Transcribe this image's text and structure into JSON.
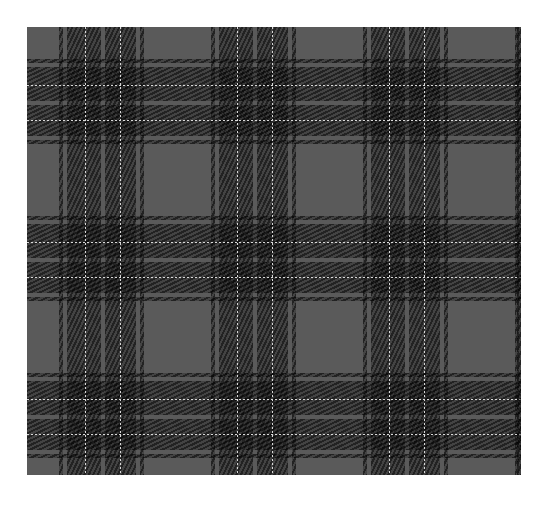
{
  "image": {
    "description": "Gray and black tartan plaid fabric pattern",
    "colors": {
      "base": "#5a5a5a",
      "dark": "#000000",
      "pinstripe": "#d8d8d8",
      "background": "#ffffff"
    },
    "pattern": {
      "repeats_x": 3,
      "repeats_y": 3,
      "period_x": 152,
      "period_y": 157,
      "stripe_set": [
        {
          "type": "dark",
          "offset": 0,
          "width": 4
        },
        {
          "type": "dark",
          "offset": 8,
          "width": 34
        },
        {
          "type": "white",
          "offset": 26,
          "width": 1
        },
        {
          "type": "dark",
          "offset": 46,
          "width": 31
        },
        {
          "type": "white",
          "offset": 61,
          "width": 1
        },
        {
          "type": "dark",
          "offset": 81,
          "width": 4
        }
      ],
      "start_x": 32,
      "start_y": 32
    }
  }
}
